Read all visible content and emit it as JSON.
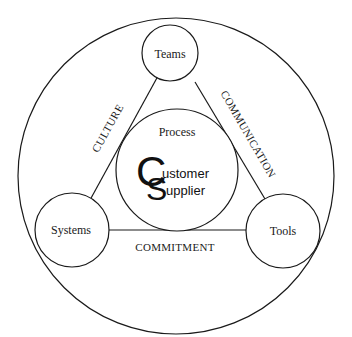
{
  "diagram": {
    "nodes": {
      "teams": "Teams",
      "systems": "Systems",
      "tools": "Tools",
      "process": "Process"
    },
    "edges": {
      "culture": "CULTURE",
      "communication": "COMMUNICATION",
      "commitment": "COMMITMENT"
    },
    "logo": {
      "letter1": "C",
      "letter2": "S",
      "word1": "ustomer",
      "word2": "upplier"
    },
    "colors": {
      "stroke": "#1a1a1a",
      "background": "#ffffff"
    }
  }
}
